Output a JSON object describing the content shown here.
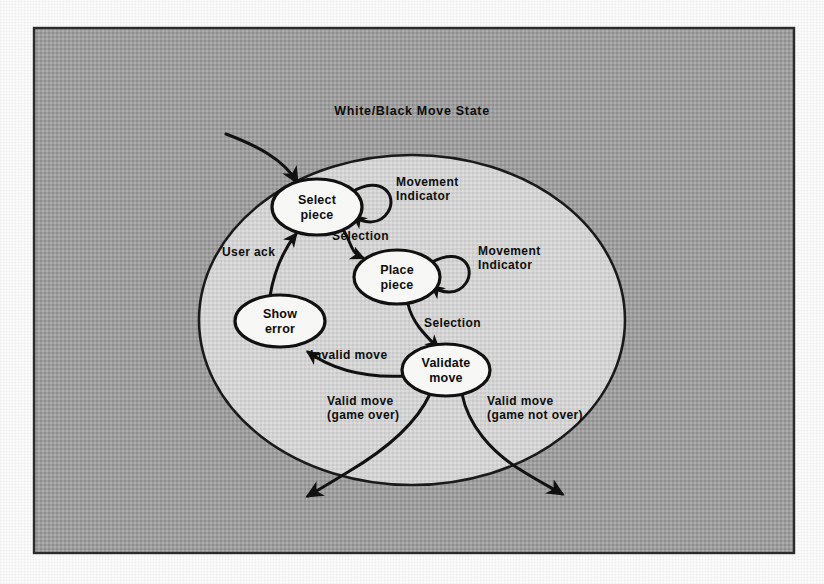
{
  "page": {
    "background_color": "#fbfbfb",
    "frame_fill_color": "#9d9d9d",
    "frame_border_color": "#2b2b2b",
    "superstate_fill_color": "#d2d2d2",
    "state_fill_color": "#f7f7f5",
    "line_color": "#111111"
  },
  "diagram": {
    "type": "state-machine",
    "title": "White/Black Move State",
    "superstate": {
      "name": "superstate-boundary",
      "label": "White/Black Move State"
    },
    "states": [
      {
        "id": "select-piece",
        "label_line1": "Select",
        "label_line2": "piece"
      },
      {
        "id": "place-piece",
        "label_line1": "Place",
        "label_line2": "piece"
      },
      {
        "id": "show-error",
        "label_line1": "Show",
        "label_line2": "error"
      },
      {
        "id": "validate-move",
        "label_line1": "Validate",
        "label_line2": "move"
      }
    ],
    "transitions": [
      {
        "id": "entry",
        "from": "external",
        "to": "select-piece",
        "label": ""
      },
      {
        "id": "select-self-loop",
        "from": "select-piece",
        "to": "select-piece",
        "label_line1": "Movement",
        "label_line2": "Indicator"
      },
      {
        "id": "select-to-place",
        "from": "select-piece",
        "to": "place-piece",
        "label": "Selection"
      },
      {
        "id": "place-self-loop",
        "from": "place-piece",
        "to": "place-piece",
        "label_line1": "Movement",
        "label_line2": "Indicator"
      },
      {
        "id": "place-to-validate",
        "from": "place-piece",
        "to": "validate-move",
        "label": "Selection"
      },
      {
        "id": "validate-to-show-error",
        "from": "validate-move",
        "to": "show-error",
        "label": "Invalid move"
      },
      {
        "id": "show-error-to-select",
        "from": "show-error",
        "to": "select-piece",
        "label": "User ack"
      },
      {
        "id": "valid-game-over",
        "from": "validate-move",
        "to": "external",
        "label_line1": "Valid move",
        "label_line2": "(game over)"
      },
      {
        "id": "valid-game-not-over",
        "from": "validate-move",
        "to": "external",
        "label_line1": "Valid move",
        "label_line2": "(game not over)"
      }
    ],
    "labels": {
      "movement_indicator_line1": "Movement",
      "movement_indicator_line2": "Indicator",
      "selection": "Selection",
      "invalid_move": "Invalid move",
      "user_ack": "User ack",
      "valid_move": "Valid move",
      "game_over": "(game over)",
      "game_not_over": "(game not over)"
    }
  }
}
